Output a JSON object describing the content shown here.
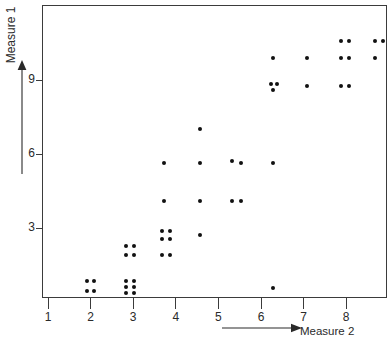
{
  "chart_data": {
    "type": "scatter",
    "title": "",
    "xlabel": "Measure 2",
    "ylabel": "Measure 1",
    "xlim": [
      0.9,
      8.9
    ],
    "ylim": [
      0.2,
      11.2
    ],
    "grid": false,
    "legend": false,
    "x_ticks": [
      1,
      2,
      3,
      4,
      5,
      6,
      7,
      8
    ],
    "y_ticks": [
      3,
      6,
      9
    ],
    "marker": "filled-circle",
    "marker_color": "#111111",
    "points": [
      {
        "x": 1.9,
        "y": 0.9
      },
      {
        "x": 2.05,
        "y": 0.9
      },
      {
        "x": 1.9,
        "y": 0.5
      },
      {
        "x": 2.05,
        "y": 0.5
      },
      {
        "x": 2.8,
        "y": 0.9
      },
      {
        "x": 3.0,
        "y": 0.9
      },
      {
        "x": 2.8,
        "y": 0.65
      },
      {
        "x": 3.0,
        "y": 0.65
      },
      {
        "x": 2.8,
        "y": 0.4
      },
      {
        "x": 3.0,
        "y": 0.4
      },
      {
        "x": 2.8,
        "y": 2.3
      },
      {
        "x": 3.0,
        "y": 2.3
      },
      {
        "x": 2.8,
        "y": 1.95
      },
      {
        "x": 3.0,
        "y": 1.95
      },
      {
        "x": 3.65,
        "y": 2.9
      },
      {
        "x": 3.85,
        "y": 2.9
      },
      {
        "x": 3.65,
        "y": 2.6
      },
      {
        "x": 3.85,
        "y": 2.6
      },
      {
        "x": 3.65,
        "y": 1.95
      },
      {
        "x": 3.85,
        "y": 1.95
      },
      {
        "x": 4.55,
        "y": 2.75
      },
      {
        "x": 3.7,
        "y": 4.15
      },
      {
        "x": 4.55,
        "y": 4.15
      },
      {
        "x": 5.3,
        "y": 4.15
      },
      {
        "x": 5.5,
        "y": 4.15
      },
      {
        "x": 3.7,
        "y": 5.7
      },
      {
        "x": 4.55,
        "y": 5.7
      },
      {
        "x": 5.3,
        "y": 5.75
      },
      {
        "x": 5.5,
        "y": 5.7
      },
      {
        "x": 6.25,
        "y": 5.7
      },
      {
        "x": 4.55,
        "y": 7.05
      },
      {
        "x": 6.2,
        "y": 8.9
      },
      {
        "x": 6.35,
        "y": 8.9
      },
      {
        "x": 6.25,
        "y": 8.65
      },
      {
        "x": 7.05,
        "y": 8.8
      },
      {
        "x": 7.85,
        "y": 8.8
      },
      {
        "x": 8.05,
        "y": 8.8
      },
      {
        "x": 6.25,
        "y": 9.95
      },
      {
        "x": 7.05,
        "y": 9.95
      },
      {
        "x": 7.85,
        "y": 9.95
      },
      {
        "x": 8.05,
        "y": 9.95
      },
      {
        "x": 8.65,
        "y": 9.95
      },
      {
        "x": 7.85,
        "y": 10.65
      },
      {
        "x": 8.05,
        "y": 10.65
      },
      {
        "x": 8.65,
        "y": 10.65
      },
      {
        "x": 8.85,
        "y": 10.65
      },
      {
        "x": 6.25,
        "y": 0.6
      }
    ]
  },
  "axes": {
    "y_axis": {
      "label": "Measure 1",
      "ticks": [
        {
          "value": 9,
          "label": "9"
        },
        {
          "value": 6,
          "label": "6"
        },
        {
          "value": 3,
          "label": "3"
        }
      ]
    },
    "x_axis": {
      "label": "Measure 2",
      "ticks": [
        {
          "value": 1,
          "label": "1"
        },
        {
          "value": 2,
          "label": "2"
        },
        {
          "value": 3,
          "label": "3"
        },
        {
          "value": 4,
          "label": "4"
        },
        {
          "value": 5,
          "label": "5"
        },
        {
          "value": 6,
          "label": "6"
        },
        {
          "value": 7,
          "label": "7"
        },
        {
          "value": 8,
          "label": "8"
        }
      ]
    }
  },
  "geometry": {
    "plot_left": 42,
    "plot_top": 5,
    "plot_width": 345,
    "plot_height": 293,
    "x_origin_px": 48,
    "x_unit_px": 42.6,
    "y_origin_px": 228,
    "y_unit_px": 24.6
  }
}
